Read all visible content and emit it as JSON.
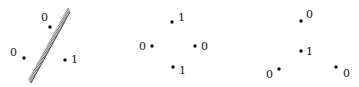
{
  "diagram": {
    "type": "labeled-point-configurations",
    "panels": [
      {
        "id": "panel-1",
        "description": "Three points separated by a hatched line",
        "separator": {
          "x1": 70,
          "y1": 12,
          "x2": 31,
          "y2": 83,
          "style": "hatched"
        },
        "points": [
          {
            "x": 50,
            "y": 27,
            "label": "0",
            "lx": 41,
            "ly": 21
          },
          {
            "x": 24,
            "y": 58,
            "label": "0",
            "lx": 10,
            "ly": 56
          },
          {
            "x": 65,
            "y": 60,
            "label": "1",
            "lx": 71,
            "ly": 63
          }
        ]
      },
      {
        "id": "panel-2",
        "description": "Four points in a diamond arrangement",
        "points": [
          {
            "x": 172,
            "y": 22,
            "label": "1",
            "lx": 178,
            "ly": 21
          },
          {
            "x": 152,
            "y": 46,
            "label": "0",
            "lx": 139,
            "ly": 50
          },
          {
            "x": 195,
            "y": 46,
            "label": "0",
            "lx": 201,
            "ly": 50
          },
          {
            "x": 173,
            "y": 67,
            "label": "1",
            "lx": 179,
            "ly": 74
          }
        ]
      },
      {
        "id": "panel-3",
        "description": "Four points: triangle with one point inside",
        "points": [
          {
            "x": 301,
            "y": 21,
            "label": "0",
            "lx": 306,
            "ly": 18
          },
          {
            "x": 301,
            "y": 51,
            "label": "1",
            "lx": 306,
            "ly": 55
          },
          {
            "x": 279,
            "y": 69,
            "label": "0",
            "lx": 266,
            "ly": 78
          },
          {
            "x": 336,
            "y": 67,
            "label": "0",
            "lx": 343,
            "ly": 77
          }
        ]
      }
    ]
  },
  "colors": {
    "ink": "#111111",
    "background": "#ffffff"
  }
}
